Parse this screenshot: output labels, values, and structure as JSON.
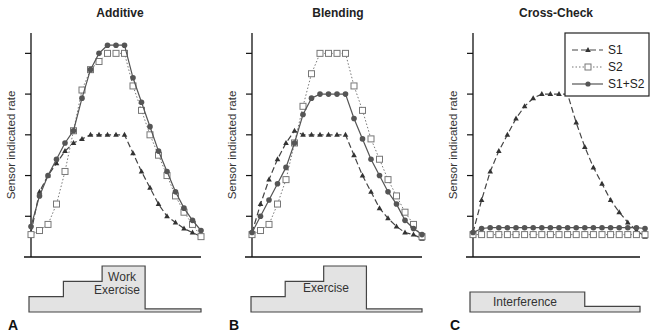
{
  "chart_data": [
    {
      "type": "line",
      "panel_letter": "A",
      "title": "Additive",
      "ylabel": "Sensor indicated rate",
      "xlabel": "",
      "ylim": [
        0,
        5.5
      ],
      "xlim": [
        0,
        20
      ],
      "yticks": [
        1,
        2,
        3,
        4,
        5
      ],
      "ytick_labels": [
        "",
        "",
        "",
        "",
        ""
      ],
      "x": [
        0,
        1,
        2,
        3,
        4,
        5,
        6,
        7,
        8,
        9,
        10,
        11,
        12,
        13,
        14,
        15,
        16,
        17,
        18,
        19,
        20
      ],
      "series": [
        {
          "name": "S1",
          "style": "dashed-triangle",
          "values": [
            0.6,
            1.6,
            2.0,
            2.3,
            2.6,
            2.8,
            2.9,
            3.0,
            3.0,
            3.0,
            3.0,
            3.0,
            2.55,
            2.1,
            1.7,
            1.3,
            1.0,
            0.85,
            0.7,
            0.6,
            0.5
          ]
        },
        {
          "name": "S2",
          "style": "dotted-square",
          "values": [
            0.55,
            0.65,
            0.8,
            1.3,
            2.1,
            3.1,
            4.1,
            4.6,
            4.8,
            5.0,
            5.0,
            5.0,
            4.2,
            3.6,
            3.0,
            2.5,
            2.0,
            1.5,
            1.1,
            0.8,
            0.5
          ]
        },
        {
          "name": "S1+S2",
          "style": "solid-circle",
          "values": [
            0.75,
            1.5,
            2.0,
            2.4,
            2.8,
            3.1,
            3.9,
            4.6,
            5.0,
            5.2,
            5.2,
            5.2,
            4.4,
            3.8,
            3.2,
            2.6,
            2.1,
            1.6,
            1.2,
            0.9,
            0.65
          ]
        }
      ],
      "stimulus": {
        "label": "Work Exercise",
        "levels": [
          0.5,
          1.0,
          1.5,
          0.1
        ],
        "breaks": [
          0,
          4,
          8.5,
          13.5,
          20
        ]
      }
    },
    {
      "type": "line",
      "panel_letter": "B",
      "title": "Blending",
      "ylabel": "Sensor indicated rate",
      "xlabel": "",
      "ylim": [
        0,
        5.5
      ],
      "xlim": [
        0,
        20
      ],
      "yticks": [
        1,
        2,
        3,
        4,
        5
      ],
      "ytick_labels": [
        "",
        "",
        "",
        "",
        ""
      ],
      "x": [
        0,
        1,
        2,
        3,
        4,
        5,
        6,
        7,
        8,
        9,
        10,
        11,
        12,
        13,
        14,
        15,
        16,
        17,
        18,
        19,
        20
      ],
      "series": [
        {
          "name": "S1",
          "style": "dashed-triangle",
          "values": [
            0.6,
            1.3,
            1.9,
            2.4,
            2.8,
            3.1,
            3.0,
            3.0,
            3.0,
            3.0,
            3.0,
            3.0,
            2.5,
            2.0,
            1.6,
            1.2,
            0.95,
            0.75,
            0.6,
            0.55,
            0.45
          ]
        },
        {
          "name": "S2",
          "style": "dotted-square",
          "values": [
            0.55,
            0.65,
            0.8,
            1.3,
            1.9,
            2.8,
            3.7,
            4.5,
            5.0,
            5.0,
            5.0,
            5.0,
            4.2,
            3.6,
            2.9,
            2.4,
            1.9,
            1.5,
            1.1,
            0.8,
            0.5
          ]
        },
        {
          "name": "S1+S2",
          "style": "solid-circle",
          "values": [
            0.6,
            1.0,
            1.4,
            1.8,
            2.2,
            2.8,
            3.5,
            3.9,
            4.0,
            4.0,
            4.0,
            4.0,
            3.4,
            2.9,
            2.4,
            2.0,
            1.6,
            1.3,
            0.9,
            0.7,
            0.55
          ]
        }
      ],
      "stimulus": {
        "label": "Exercise",
        "levels": [
          0.5,
          1.0,
          1.5,
          0.1
        ],
        "breaks": [
          0,
          4,
          8.5,
          13.5,
          20
        ]
      }
    },
    {
      "type": "line",
      "panel_letter": "C",
      "title": "Cross-Check",
      "ylabel": "Sensor indicated rate",
      "xlabel": "",
      "ylim": [
        0,
        5.5
      ],
      "xlim": [
        0,
        20
      ],
      "yticks": [
        1,
        2,
        3,
        4,
        5
      ],
      "ytick_labels": [
        "",
        "",
        "",
        "",
        ""
      ],
      "x": [
        0,
        1,
        2,
        3,
        4,
        5,
        6,
        7,
        8,
        9,
        10,
        11,
        12,
        13,
        14,
        15,
        16,
        17,
        18,
        19,
        20
      ],
      "series": [
        {
          "name": "S1",
          "style": "dashed-triangle",
          "values": [
            0.6,
            1.4,
            2.1,
            2.6,
            3.0,
            3.4,
            3.7,
            3.9,
            4.0,
            4.0,
            4.0,
            4.0,
            3.3,
            2.7,
            2.2,
            1.8,
            1.4,
            1.1,
            0.85,
            0.65,
            0.5
          ]
        },
        {
          "name": "S2",
          "style": "dotted-square",
          "values": [
            0.55,
            0.55,
            0.55,
            0.55,
            0.55,
            0.55,
            0.55,
            0.55,
            0.55,
            0.55,
            0.55,
            0.55,
            0.55,
            0.55,
            0.55,
            0.55,
            0.55,
            0.55,
            0.55,
            0.55,
            0.55
          ]
        },
        {
          "name": "S1+S2",
          "style": "solid-circle",
          "values": [
            0.6,
            0.7,
            0.72,
            0.72,
            0.72,
            0.72,
            0.72,
            0.72,
            0.72,
            0.72,
            0.72,
            0.72,
            0.72,
            0.72,
            0.72,
            0.72,
            0.72,
            0.72,
            0.72,
            0.72,
            0.7
          ]
        }
      ],
      "stimulus": {
        "label": "Interference",
        "levels": [
          0.7,
          0.2
        ],
        "breaks": [
          0,
          13.5,
          20
        ]
      },
      "legend": {
        "placement": "top-right",
        "entries": [
          "S1",
          "S2",
          "S1+S2"
        ]
      }
    }
  ]
}
